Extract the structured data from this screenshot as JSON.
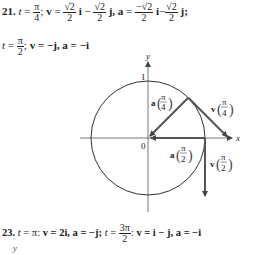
{
  "problem21": {
    "number": "21.",
    "line1": {
      "t_label": "t",
      "eq": "=",
      "t_num": "π",
      "t_den": "4",
      "sep": ";",
      "v_label": "v",
      "v_eq": "=",
      "v_i_num": "√2",
      "v_i_den": "2",
      "i": "i",
      "minus": "−",
      "v_j_num": "√2",
      "v_j_den": "2",
      "j": "j,",
      "a_label": "a",
      "a_eq": "=",
      "a_i_num": "−√2",
      "a_i_den": "2",
      "a_i": "i",
      "a_minus": "−",
      "a_j_num": "√2",
      "a_j_den": "2",
      "a_j": "j;"
    },
    "line2": {
      "t_label": "t",
      "eq": "=",
      "t_num": "π",
      "t_den": "2",
      "sep": ";",
      "v_label": "v",
      "v_val": "= −j,",
      "a_label": "a",
      "a_val": "= −i"
    }
  },
  "diagram": {
    "x_axis_label": "x",
    "y_axis_label": "y",
    "origin_label": "0",
    "y_tick_label": "1",
    "vectors": [
      {
        "name": "a",
        "arg_num": "π",
        "arg_den": "4"
      },
      {
        "name": "v",
        "arg_num": "π",
        "arg_den": "4"
      },
      {
        "name": "a",
        "arg_num": "π",
        "arg_den": "2"
      },
      {
        "name": "v",
        "arg_num": "π",
        "arg_den": "2"
      }
    ]
  },
  "problem23": {
    "number": "23.",
    "t1_label": "t",
    "t1_val": "= π:",
    "v1_label": "v",
    "v1_val": "= 2i,",
    "a1_label": "a",
    "a1_val": "= −j;",
    "t2_label": "t",
    "t2_eq": "=",
    "t2_num": "3π",
    "t2_den": "2",
    "sep": ":",
    "v2_label": "v",
    "v2_val": "= i − j,",
    "a2_label": "a",
    "a2_val": "= −i"
  },
  "next_diagram": {
    "y_axis_label": "y"
  }
}
